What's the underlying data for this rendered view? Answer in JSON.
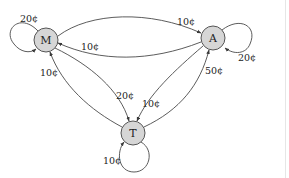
{
  "diagram": {
    "type": "state-transition-graph",
    "nodes": [
      {
        "id": "M",
        "label": "M",
        "cx": 46,
        "cy": 40,
        "r": 12
      },
      {
        "id": "A",
        "label": "A",
        "cx": 213,
        "cy": 38,
        "r": 12
      },
      {
        "id": "T",
        "label": "T",
        "cx": 133,
        "cy": 133,
        "r": 12
      }
    ],
    "edges": [
      {
        "id": "M-M",
        "from": "M",
        "to": "M",
        "label": "20¢"
      },
      {
        "id": "A-A",
        "from": "A",
        "to": "A",
        "label": "20¢"
      },
      {
        "id": "T-T",
        "from": "T",
        "to": "T",
        "label": "10¢"
      },
      {
        "id": "M-A",
        "from": "M",
        "to": "A",
        "label": "10¢"
      },
      {
        "id": "A-M",
        "from": "A",
        "to": "M",
        "label": "10¢"
      },
      {
        "id": "T-M",
        "from": "T",
        "to": "M",
        "label": "10¢"
      },
      {
        "id": "M-T",
        "from": "M",
        "to": "T",
        "label": "20¢"
      },
      {
        "id": "A-T",
        "from": "A",
        "to": "T",
        "label": "10¢"
      },
      {
        "id": "T-A",
        "from": "T",
        "to": "A",
        "label": "50¢"
      }
    ],
    "colors": {
      "node_fill": "#d6d6d6",
      "node_stroke": "#555555",
      "edge_stroke": "#4a4a4a",
      "text": "#222222"
    }
  }
}
